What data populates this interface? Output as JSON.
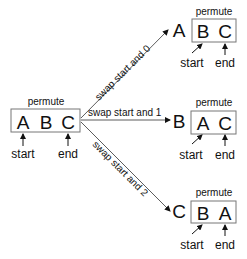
{
  "root": {
    "title": "permute",
    "letters": [
      "A",
      "B",
      "C"
    ],
    "start_label": "start",
    "end_label": "end"
  },
  "edges": [
    {
      "label": "swap start and 0"
    },
    {
      "label": "swap start and 1"
    },
    {
      "label": "swap start and 2"
    }
  ],
  "children": [
    {
      "fixed": "A",
      "title": "permute",
      "letters": [
        "B",
        "C"
      ],
      "start_label": "start",
      "end_label": "end"
    },
    {
      "fixed": "B",
      "title": "permute",
      "letters": [
        "A",
        "C"
      ],
      "start_label": "start",
      "end_label": "end"
    },
    {
      "fixed": "C",
      "title": "permute",
      "letters": [
        "B",
        "A"
      ],
      "start_label": "start",
      "end_label": "end"
    }
  ]
}
